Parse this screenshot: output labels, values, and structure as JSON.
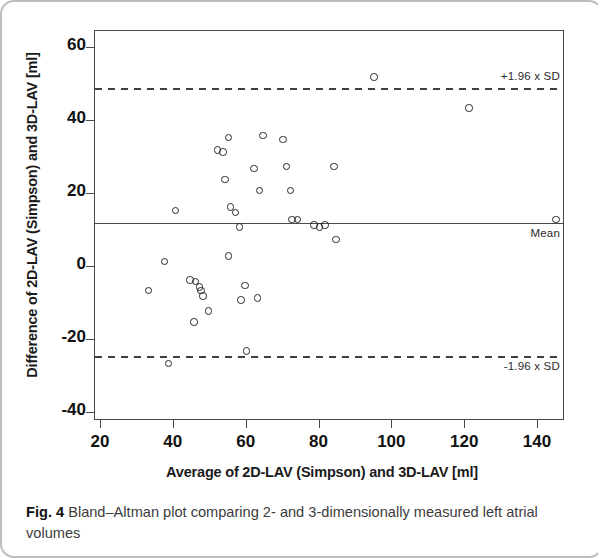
{
  "figure": {
    "caption_label": "Fig. 4",
    "caption_text": " Bland–Altman plot comparing 2- and 3-dimensionally measured left atrial volumes"
  },
  "chart_data": {
    "type": "scatter",
    "title": "",
    "xlabel": "Average of 2D-LAV (Simpson) and 3D-LAV [ml]",
    "ylabel": "Difference of 2D-LAV (Simpson) and 3D-LAV [ml]",
    "xlim": [
      14,
      150
    ],
    "ylim": [
      -46,
      67
    ],
    "xticks": [
      20,
      40,
      60,
      80,
      100,
      120,
      140
    ],
    "yticks": [
      60,
      40,
      20,
      0,
      -20,
      -40
    ],
    "xtick_labels": [
      "20",
      "40",
      "60",
      "80",
      "100",
      "120",
      "140"
    ],
    "ytick_labels": [
      "60",
      "40",
      "20",
      "0",
      "-20",
      "-40"
    ],
    "grid": false,
    "legend": null,
    "marker": "open-circle",
    "marker_color": "#262626",
    "reference_lines": [
      {
        "name": "upper-loa",
        "label": "+1.96 x SD",
        "value": 49.0,
        "style": "dashed",
        "label_position": "above-right"
      },
      {
        "name": "mean",
        "label": "Mean",
        "value": 12.0,
        "style": "solid",
        "label_position": "below-right"
      },
      {
        "name": "lower-loa",
        "label": "-1.96 x SD",
        "value": -24.5,
        "style": "dashed",
        "label_position": "below-right"
      }
    ],
    "points": [
      {
        "x": 33.0,
        "y": -6.5
      },
      {
        "x": 37.5,
        "y": 1.5
      },
      {
        "x": 38.5,
        "y": -26.5
      },
      {
        "x": 40.5,
        "y": 15.5
      },
      {
        "x": 44.5,
        "y": -3.5
      },
      {
        "x": 46.0,
        "y": -4.0
      },
      {
        "x": 47.0,
        "y": -5.5
      },
      {
        "x": 47.5,
        "y": -6.5
      },
      {
        "x": 48.0,
        "y": -8.0
      },
      {
        "x": 45.5,
        "y": -15.0
      },
      {
        "x": 49.5,
        "y": -12.0
      },
      {
        "x": 52.0,
        "y": 32.0
      },
      {
        "x": 53.5,
        "y": 31.5
      },
      {
        "x": 55.0,
        "y": 35.5
      },
      {
        "x": 54.0,
        "y": 24.0
      },
      {
        "x": 55.5,
        "y": 16.5
      },
      {
        "x": 55.0,
        "y": 3.0
      },
      {
        "x": 57.0,
        "y": 15.0
      },
      {
        "x": 58.0,
        "y": 11.0
      },
      {
        "x": 59.5,
        "y": -5.0
      },
      {
        "x": 58.5,
        "y": -9.0
      },
      {
        "x": 60.0,
        "y": -23.0
      },
      {
        "x": 62.0,
        "y": 27.0
      },
      {
        "x": 64.5,
        "y": 36.0
      },
      {
        "x": 63.5,
        "y": 21.0
      },
      {
        "x": 63.0,
        "y": -8.5
      },
      {
        "x": 70.0,
        "y": 35.0
      },
      {
        "x": 71.0,
        "y": 27.5
      },
      {
        "x": 72.0,
        "y": 21.0
      },
      {
        "x": 72.5,
        "y": 13.0
      },
      {
        "x": 74.0,
        "y": 13.0
      },
      {
        "x": 78.5,
        "y": 11.5
      },
      {
        "x": 80.0,
        "y": 11.0
      },
      {
        "x": 81.5,
        "y": 11.5
      },
      {
        "x": 84.0,
        "y": 27.5
      },
      {
        "x": 84.5,
        "y": 7.5
      },
      {
        "x": 95.0,
        "y": 52.0
      },
      {
        "x": 121.0,
        "y": 43.5
      },
      {
        "x": 145.0,
        "y": 13.0
      }
    ]
  }
}
